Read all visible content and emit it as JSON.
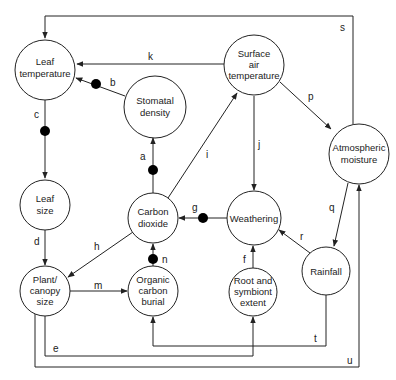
{
  "nodes": {
    "leaf_temperature": {
      "line1": "Leaf",
      "line2": "temperature"
    },
    "stomatal_density": {
      "line1": "Stomatal",
      "line2": "density"
    },
    "surface_air_temperature": {
      "line1": "Surface",
      "line2": "air",
      "line3": "temperature"
    },
    "atmospheric_moisture": {
      "line1": "Atmospheric",
      "line2": "moisture"
    },
    "leaf_size": {
      "line1": "Leaf",
      "line2": "size"
    },
    "carbon_dioxide": {
      "line1": "Carbon",
      "line2": "dioxide"
    },
    "weathering": {
      "line1": "Weathering"
    },
    "plant_canopy_size": {
      "line1": "Plant/",
      "line2": "canopy",
      "line3": "size"
    },
    "organic_carbon_burial": {
      "line1": "Organic",
      "line2": "carbon",
      "line3": "burial"
    },
    "root_symbiont_extent": {
      "line1": "Root and",
      "line2": "symbiont",
      "line3": "extent"
    },
    "rainfall": {
      "line1": "Rainfall"
    }
  },
  "edges": {
    "a": "a",
    "b": "b",
    "c": "c",
    "d": "d",
    "e": "e",
    "f": "f",
    "g": "g",
    "h": "h",
    "i": "i",
    "j": "j",
    "k": "k",
    "m": "m",
    "n": "n",
    "p": "p",
    "q": "q",
    "r": "r",
    "s": "s",
    "t": "t",
    "u": "u"
  },
  "edge_list": [
    {
      "label": "a",
      "from": "Carbon dioxide",
      "to": "Stomatal density",
      "negative": true
    },
    {
      "label": "b",
      "from": "Stomatal density",
      "to": "Leaf temperature",
      "negative": true
    },
    {
      "label": "c",
      "from": "Leaf temperature",
      "to": "Leaf size",
      "negative": true
    },
    {
      "label": "d",
      "from": "Leaf size",
      "to": "Plant/canopy size",
      "negative": false
    },
    {
      "label": "e",
      "from": "Plant/canopy size",
      "to": "Root and symbiont extent",
      "negative": false
    },
    {
      "label": "f",
      "from": "Root and symbiont extent",
      "to": "Weathering",
      "negative": false
    },
    {
      "label": "g",
      "from": "Weathering",
      "to": "Carbon dioxide",
      "negative": true
    },
    {
      "label": "h",
      "from": "Carbon dioxide",
      "to": "Plant/canopy size",
      "negative": false
    },
    {
      "label": "i",
      "from": "Carbon dioxide",
      "to": "Surface air temperature",
      "negative": false
    },
    {
      "label": "j",
      "from": "Surface air temperature",
      "to": "Weathering",
      "negative": false
    },
    {
      "label": "k",
      "from": "Surface air temperature",
      "to": "Leaf temperature",
      "negative": false
    },
    {
      "label": "m",
      "from": "Plant/canopy size",
      "to": "Organic carbon burial",
      "negative": false
    },
    {
      "label": "n",
      "from": "Organic carbon burial",
      "to": "Carbon dioxide",
      "negative": true
    },
    {
      "label": "p",
      "from": "Surface air temperature",
      "to": "Atmospheric moisture",
      "negative": false
    },
    {
      "label": "q",
      "from": "Atmospheric moisture",
      "to": "Rainfall",
      "negative": false
    },
    {
      "label": "r",
      "from": "Rainfall",
      "to": "Weathering",
      "negative": false
    },
    {
      "label": "s",
      "from": "Atmospheric moisture",
      "to": "Leaf temperature",
      "negative": false
    },
    {
      "label": "t",
      "from": "Rainfall",
      "to": "Organic carbon burial",
      "negative": false
    },
    {
      "label": "u",
      "from": "Plant/canopy size",
      "to": "Atmospheric moisture",
      "negative": false
    }
  ]
}
